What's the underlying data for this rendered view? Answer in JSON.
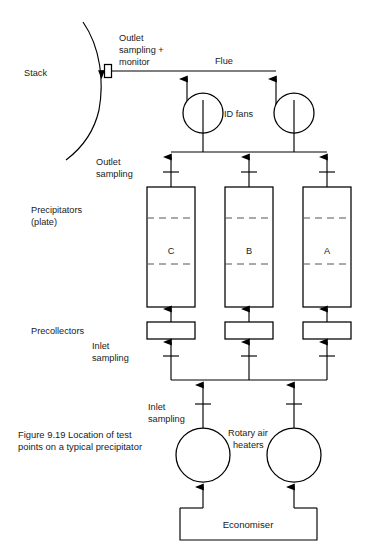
{
  "figure": {
    "caption_line1": "Figure 9.19 Location of test",
    "caption_line2": "points on a typical precipitator",
    "caption_full": "Figure 9.19 Location of test points on a typical precipitator"
  },
  "labels": {
    "stack": "Stack",
    "outlet_monitor_line1": "Outlet",
    "outlet_monitor_line2": "sampling +",
    "outlet_monitor_line3": "monitor",
    "flue": "Flue",
    "id_fans": "ID fans",
    "outlet_sampling_line1": "Outlet",
    "outlet_sampling_line2": "sampling",
    "precipitators_line1": "Precipitators",
    "precipitators_line2": "(plate)",
    "precollectors": "Precollectors",
    "inlet_sampling_upper_line1": "Inlet",
    "inlet_sampling_upper_line2": "sampling",
    "inlet_sampling_lower_line1": "Inlet",
    "inlet_sampling_lower_line2": "sampling",
    "rotary_air_heaters_line1": "Rotary air",
    "rotary_air_heaters_line2": "heaters",
    "economiser": "Economiser"
  },
  "precipitators": [
    {
      "id": "C",
      "label": "C"
    },
    {
      "id": "B",
      "label": "B"
    },
    {
      "id": "A",
      "label": "A"
    }
  ],
  "components": {
    "stack": "stack-arc",
    "monitor_box": "outlet-monitor-box",
    "id_fan_count": 2,
    "precollector_count": 3,
    "rotary_air_heater_count": 2,
    "economiser": "economiser-box"
  },
  "colors": {
    "line": "#000000",
    "dashed_line": "#555555",
    "text": "#1a1a1a",
    "background": "#ffffff"
  }
}
